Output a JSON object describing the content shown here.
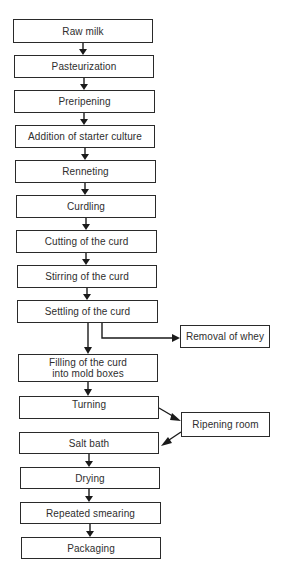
{
  "diagram": {
    "type": "process-flowchart",
    "main_steps": [
      {
        "id": "raw-milk",
        "label": "Raw milk"
      },
      {
        "id": "pasteurization",
        "label": "Pasteurization"
      },
      {
        "id": "preripening",
        "label": "Preripening"
      },
      {
        "id": "addition-of-starter-culture",
        "label": "Addition of starter culture"
      },
      {
        "id": "renneting",
        "label": "Renneting"
      },
      {
        "id": "curdling",
        "label": "Curdling"
      },
      {
        "id": "cutting-of-the-curd",
        "label": "Cutting of the curd"
      },
      {
        "id": "stirring-of-the-curd",
        "label": "Stirring of the curd"
      },
      {
        "id": "settling-of-the-curd",
        "label": "Settling of the curd"
      },
      {
        "id": "filling-of-the-curd",
        "label_line1": "Filling of the curd",
        "label_line2": "into mold boxes"
      },
      {
        "id": "turning",
        "label": "Turning"
      },
      {
        "id": "salt-bath",
        "label": "Salt bath"
      },
      {
        "id": "drying",
        "label": "Drying"
      },
      {
        "id": "repeated-smearing",
        "label": "Repeated smearing"
      },
      {
        "id": "packaging",
        "label": "Packaging"
      }
    ],
    "side_steps": [
      {
        "id": "removal-of-whey",
        "label": "Removal of whey"
      },
      {
        "id": "ripening-room",
        "label": "Ripening room"
      }
    ],
    "edges": [
      [
        "raw-milk",
        "pasteurization"
      ],
      [
        "pasteurization",
        "preripening"
      ],
      [
        "preripening",
        "addition-of-starter-culture"
      ],
      [
        "addition-of-starter-culture",
        "renneting"
      ],
      [
        "renneting",
        "curdling"
      ],
      [
        "curdling",
        "cutting-of-the-curd"
      ],
      [
        "cutting-of-the-curd",
        "stirring-of-the-curd"
      ],
      [
        "stirring-of-the-curd",
        "settling-of-the-curd"
      ],
      [
        "settling-of-the-curd",
        "filling-of-the-curd"
      ],
      [
        "settling-of-the-curd",
        "removal-of-whey"
      ],
      [
        "filling-of-the-curd",
        "turning"
      ],
      [
        "turning",
        "ripening-room"
      ],
      [
        "ripening-room",
        "salt-bath"
      ],
      [
        "salt-bath",
        "drying"
      ],
      [
        "drying",
        "repeated-smearing"
      ],
      [
        "repeated-smearing",
        "packaging"
      ]
    ]
  }
}
